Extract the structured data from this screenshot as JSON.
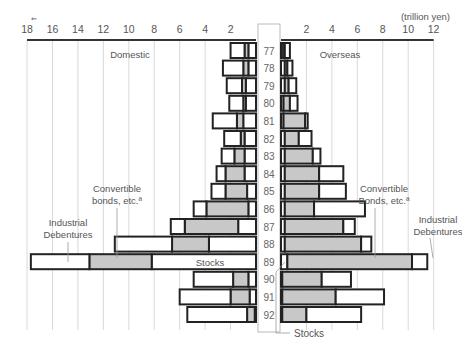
{
  "chart_data": {
    "type": "bar",
    "orientation": "horizontal-butterfly",
    "title": "",
    "unit_label": "(trillion yen)",
    "xlabel": "",
    "ylabel": "",
    "left_panel_label": "Domestic",
    "right_panel_label": "Overseas",
    "left_ticks": [
      "18",
      "16",
      "14",
      "12",
      "10",
      "8",
      "6",
      "4",
      "2"
    ],
    "right_ticks": [
      "2",
      "4",
      "6",
      "8",
      "10",
      "12"
    ],
    "xlim_left": [
      0,
      18
    ],
    "xlim_right": [
      0,
      12
    ],
    "grid": true,
    "categories": [
      "77",
      "78",
      "79",
      "80",
      "81",
      "82",
      "83",
      "84",
      "85",
      "86",
      "87",
      "88",
      "89",
      "90",
      "91",
      "92"
    ],
    "segment_order": [
      "Stocks",
      "Convertible bonds, etc.",
      "Industrial Debentures"
    ],
    "domestic": {
      "series": [
        {
          "name": "Stocks",
          "color": "#ffffff",
          "values": [
            0.6,
            0.6,
            0.8,
            0.8,
            1.0,
            0.9,
            0.9,
            0.9,
            0.7,
            0.6,
            1.4,
            3.7,
            8.2,
            0.6,
            0.5,
            0.1
          ]
        },
        {
          "name": "Convertible bonds, etc.",
          "color": "#c8c8c8",
          "values": [
            0.3,
            0.4,
            0.3,
            0.2,
            0.5,
            0.3,
            0.8,
            1.5,
            1.7,
            3.3,
            4.2,
            2.9,
            4.9,
            1.2,
            1.5,
            0.6
          ]
        },
        {
          "name": "Industrial Debentures",
          "color": "#ffffff",
          "values": [
            1.1,
            1.6,
            1.2,
            1.1,
            1.9,
            1.3,
            1.0,
            0.7,
            1.1,
            1.0,
            1.1,
            4.5,
            4.6,
            3.1,
            4.0,
            4.7
          ]
        }
      ]
    },
    "overseas": {
      "series": [
        {
          "name": "Stocks",
          "color": "#ffffff",
          "values": [
            0.3,
            0.3,
            0.3,
            0.2,
            0.2,
            0.3,
            0.3,
            0.3,
            0.3,
            0.3,
            0.3,
            0.3,
            0.5,
            0.1,
            0.1,
            0.1
          ]
        },
        {
          "name": "Convertible bonds, etc.",
          "color": "#c8c8c8",
          "values": [
            0.0,
            0.2,
            0.3,
            0.5,
            1.7,
            1.1,
            2.2,
            2.7,
            2.7,
            2.3,
            4.6,
            6.0,
            9.8,
            3.1,
            4.2,
            1.9
          ]
        },
        {
          "name": "Industrial Debentures",
          "color": "#ffffff",
          "values": [
            0.4,
            0.4,
            0.6,
            0.6,
            0.2,
            1.0,
            0.6,
            1.9,
            2.1,
            4.0,
            0.9,
            0.8,
            1.2,
            2.3,
            3.8,
            4.3
          ]
        }
      ]
    },
    "annotations": {
      "domestic_convertible": [
        "Convertible",
        "bonds, etc.ª"
      ],
      "domestic_industrial": [
        "Industrial",
        "Debentures"
      ],
      "domestic_stocks": "Stocks",
      "overseas_convertible": [
        "Convertible",
        "Bonds, etc.ª"
      ],
      "overseas_industrial": [
        "Industrial",
        "Debentures"
      ],
      "overseas_stocks": "Stocks"
    }
  }
}
